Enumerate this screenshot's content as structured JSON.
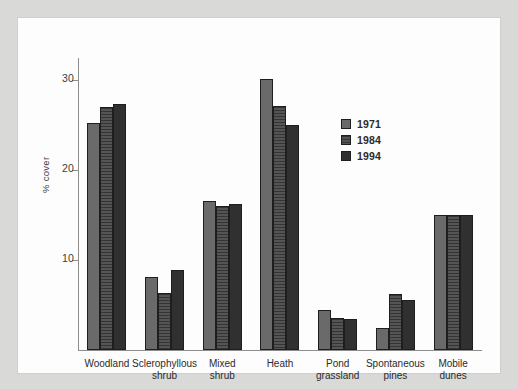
{
  "chart_data": {
    "type": "bar",
    "title": "",
    "subtitle": "",
    "xlabel": "",
    "ylabel": "% cover",
    "ylim": [
      0,
      32.5
    ],
    "yticks": [
      10,
      20,
      30
    ],
    "ytick_labels": [
      "10",
      "20",
      "30"
    ],
    "grid": false,
    "legend_position": "upper-center-right",
    "categories": [
      "Woodland",
      "Sclerophyllous shrub",
      "Mixed shrub",
      "Heath",
      "Pond grassland",
      "Spontaneous pines",
      "Mobile dunes"
    ],
    "category_label_lines": [
      [
        "Woodland"
      ],
      [
        "Sclerophyllous",
        "shrub"
      ],
      [
        "Mixed",
        "shrub"
      ],
      [
        "Heath"
      ],
      [
        "Pond",
        "grassland"
      ],
      [
        "Spontaneous",
        "pines"
      ],
      [
        "Mobile",
        "dunes"
      ]
    ],
    "series": [
      {
        "name": "1971",
        "color": "#6a6a6a",
        "values": [
          25.3,
          8.1,
          16.6,
          30.2,
          4.5,
          2.4,
          15.0
        ]
      },
      {
        "name": "1984",
        "color": "#4a4a4a",
        "values": [
          27.1,
          6.3,
          16.0,
          27.2,
          3.6,
          6.2,
          15.0
        ]
      },
      {
        "name": "1994",
        "color": "#303030",
        "values": [
          27.4,
          8.9,
          16.3,
          25.1,
          3.4,
          5.6,
          15.0
        ]
      }
    ]
  },
  "legend": {
    "items": [
      {
        "label": "1971",
        "color": "#6a6a6a"
      },
      {
        "label": "1984",
        "color": "#4a4a4a"
      },
      {
        "label": "1994",
        "color": "#303030"
      }
    ]
  },
  "axes": {
    "y_title": "% cover",
    "y_ticks": [
      "30",
      "20",
      "10"
    ]
  }
}
